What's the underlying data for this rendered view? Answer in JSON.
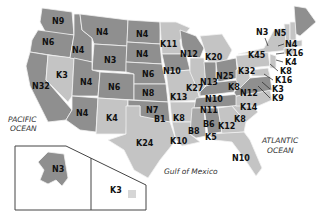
{
  "map": {
    "title": "United States map with state codes",
    "colors": {
      "dark_state": "#8f8f8f",
      "light_state": "#c4c4c4",
      "border": "#f2f2f2",
      "label": "#111111",
      "inset_frame": "#444444"
    },
    "oceans": {
      "pacific_line1": "PACIFIC",
      "pacific_line2": "OCEAN",
      "atlantic_line1": "ATLANTIC",
      "atlantic_line2": "OCEAN",
      "gulf": "Gulf of Mexico"
    },
    "states": {
      "washington": "N9",
      "oregon": "N6",
      "idaho": "N4",
      "montana": "N4",
      "wyoming": "N3",
      "north_dakota": "N4",
      "south_dakota": "N4",
      "nebraska": "N6",
      "kansas": "N8",
      "oklahoma": "N7",
      "texas": "K24",
      "new_mexico": "K4",
      "arizona": "N4",
      "utah": "N4",
      "colorado": "N6",
      "nevada": "K3",
      "california": "N32",
      "minnesota": "K11",
      "iowa": "N10",
      "missouri": "K13",
      "arkansas": "K8",
      "louisiana": "K10",
      "wisconsin": "N12",
      "illinois": "K27",
      "michigan": "K20",
      "indiana": "N13",
      "ohio": "N25",
      "kentucky": "N10",
      "tennessee": "N11",
      "mississippi": "B8",
      "alabama": "B6",
      "georgia": "K12",
      "florida": "N10",
      "south_carolina": "K8",
      "north_carolina": "K14",
      "virginia": "N12",
      "west_virginia": "K8",
      "pennsylvania": "K32",
      "new_york": "K45",
      "vermont": "N3",
      "maine": "N5",
      "new_hampshire": "N4",
      "massachusetts": "K16",
      "rhode_island": "K4",
      "connecticut": "K8",
      "new_jersey": "K16",
      "delaware": "K3",
      "maryland": "K9",
      "alaska": "N3",
      "hawaii": "K3",
      "oklahoma_sub": "B1",
      "mississippi_sub": "K5"
    }
  }
}
